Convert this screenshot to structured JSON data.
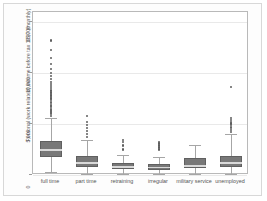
{
  "chart_data": {
    "type": "box",
    "title": "",
    "subtitle": "",
    "xlabel": "",
    "ylabel": "Personal (work related) income before tax 1997 (monthly)",
    "ylim": [
      0,
      16000
    ],
    "yticks": [
      0,
      5000,
      10000,
      15000
    ],
    "ytick_labels": [
      "0",
      "5,000",
      "10,000",
      "15,000"
    ],
    "grid": "horizontal",
    "legend": "none",
    "categories": [
      "full time",
      "part time",
      "retraining",
      "irregular",
      "military service",
      "unemployed"
    ],
    "boxes": [
      {
        "category": "full time",
        "whisker_low": 260,
        "q1": 1750,
        "median": 2450,
        "q3": 3300,
        "whisker_high": 5600,
        "outliers": [
          5800,
          5950,
          6050,
          6150,
          6300,
          6400,
          6500,
          6650,
          6800,
          6900,
          7050,
          7200,
          7350,
          7500,
          7650,
          7800,
          7950,
          8100,
          8300,
          8500,
          8700,
          8900,
          9150,
          9400,
          9700,
          10000,
          10400,
          10900,
          11500,
          12300,
          13200
        ]
      },
      {
        "category": "part time",
        "whisker_low": 120,
        "q1": 800,
        "median": 1200,
        "q3": 1900,
        "whisker_high": 3400,
        "outliers": [
          3700,
          4000,
          4300,
          4600,
          4900,
          5200,
          5800
        ]
      },
      {
        "category": "retraining",
        "whisker_low": 100,
        "q1": 550,
        "median": 800,
        "q3": 1150,
        "whisker_high": 1950,
        "outliers": [
          2500,
          2900,
          3250,
          3400
        ]
      },
      {
        "category": "irregular",
        "whisker_low": 60,
        "q1": 500,
        "median": 750,
        "q3": 1100,
        "whisker_high": 1800,
        "outliers": [
          2500,
          2700,
          2900,
          3100,
          3250
        ]
      },
      {
        "category": "military service",
        "whisker_low": 90,
        "q1": 650,
        "median": 900,
        "q3": 1700,
        "whisker_high": 2900,
        "outliers": []
      },
      {
        "category": "unemployed",
        "whisker_low": 80,
        "q1": 750,
        "median": 1150,
        "q3": 1900,
        "whisker_high": 4000,
        "outliers": [
          4200,
          4400,
          4600,
          4750,
          4900,
          5050,
          5200,
          5400,
          5600,
          8600
        ]
      }
    ],
    "colors": {
      "box_fill": "#787878",
      "box_edge": "#606060",
      "median": "#d9d9d9",
      "whisker": "#a6a6a6",
      "outlier": "#5e5e5e",
      "gridline": "#e9e9e9",
      "axis": "#b9b9b9",
      "text": "#555555",
      "background": "#ffffff"
    }
  }
}
